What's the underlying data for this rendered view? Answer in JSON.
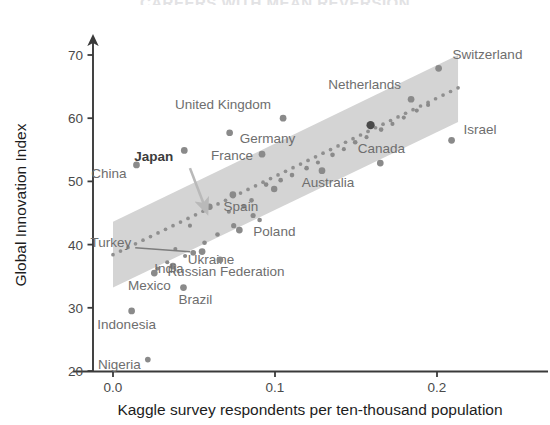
{
  "title": "CAREERS WITH MEAN REVERSION",
  "axes": {
    "x_label": "Kaggle survey respondents per ten-thousand population",
    "y_label": "Global Innovation Index",
    "x_ticks": [
      "0.0",
      "0.1",
      "0.2"
    ],
    "y_ticks": [
      "20",
      "30",
      "40",
      "50",
      "60",
      "70"
    ]
  },
  "colors": {
    "point": "#8a8a8a",
    "point_highlight": "#4a4a4a",
    "band": "#d4d4d4",
    "trend": "#8f8f8f",
    "axis": "#3a3a3a",
    "label": "#6e6e6e",
    "title": "#e2e2e4"
  },
  "chart_data": {
    "type": "scatter",
    "title": "CAREERS WITH MEAN REVERSION",
    "xlabel": "Kaggle survey respondents per ten-thousand population",
    "ylabel": "Global Innovation Index",
    "xlim": [
      -0.012,
      0.225
    ],
    "ylim": [
      19.0,
      72.5
    ],
    "xticks": [
      0.0,
      0.1,
      0.2
    ],
    "yticks": [
      20,
      30,
      40,
      50,
      60,
      70
    ],
    "grid": false,
    "legend": null,
    "points": [
      {
        "label": "Switzerland",
        "x": 0.201,
        "y": 67.9,
        "size": 5.2,
        "label_dx": 14,
        "label_dy": -9,
        "anchor": "start"
      },
      {
        "label": "Netherlands",
        "x": 0.184,
        "y": 63.0,
        "size": 5.2,
        "label_dx": -10,
        "label_dy": -10,
        "anchor": "end"
      },
      {
        "label": "Israel",
        "x": 0.209,
        "y": 56.5,
        "size": 5.2,
        "label_dx": 12,
        "label_dy": -6,
        "anchor": "start"
      },
      {
        "label": "Canada",
        "x": 0.165,
        "y": 52.9,
        "size": 5.2,
        "label_dx": 1,
        "label_dy": -10,
        "anchor": "middle"
      },
      {
        "label": "Australia",
        "x": 0.129,
        "y": 51.7,
        "size": 5.2,
        "label_dx": 6,
        "label_dy": 16,
        "anchor": "middle"
      },
      {
        "label": "United Kingdom",
        "x": 0.105,
        "y": 60.0,
        "size": 5.2,
        "label_dx": -12,
        "label_dy": -9,
        "anchor": "end"
      },
      {
        "label": "Germany",
        "x": 0.072,
        "y": 57.7,
        "size": 5.2,
        "label_dx": 10,
        "label_dy": 10,
        "anchor": "start"
      },
      {
        "label": "France",
        "x": 0.092,
        "y": 54.3,
        "size": 5.2,
        "label_dx": -9,
        "label_dy": 6,
        "anchor": "end"
      },
      {
        "label": "Japan",
        "x": 0.044,
        "y": 54.9,
        "size": 5.2,
        "label_dx": -11,
        "label_dy": 11,
        "anchor": "end",
        "bold": true
      },
      {
        "label": "China",
        "x": 0.0145,
        "y": 52.6,
        "size": 5.2,
        "label_dx": -10,
        "label_dy": 13,
        "anchor": "end"
      },
      {
        "label": "Spain",
        "x": 0.074,
        "y": 47.9,
        "size": 5.2,
        "label_dx": 8,
        "label_dy": 16,
        "anchor": "middle"
      },
      {
        "label": "Poland",
        "x": 0.078,
        "y": 42.3,
        "size": 5.2,
        "label_dx": 14,
        "label_dy": 6,
        "anchor": "start"
      },
      {
        "label": "Ukraine",
        "x": 0.055,
        "y": 38.9,
        "size": 5.2,
        "label_dx": 9,
        "label_dy": 12,
        "anchor": "middle"
      },
      {
        "label": "Russian Federation",
        "x": 0.066,
        "y": 37.6,
        "size": 5.2,
        "label_dx": 6,
        "label_dy": 16,
        "anchor": "middle"
      },
      {
        "label": "Turkey",
        "x": 0.0495,
        "y": 38.7,
        "size": 4.4,
        "label_dx": -62,
        "label_dy": -6,
        "anchor": "end",
        "leader": true
      },
      {
        "label": "India",
        "x": 0.037,
        "y": 36.6,
        "size": 5.2,
        "label_dx": -4,
        "label_dy": 7,
        "anchor": "middle"
      },
      {
        "label": "Mexico",
        "x": 0.0255,
        "y": 35.5,
        "size": 5.2,
        "label_dx": -5,
        "label_dy": 17,
        "anchor": "middle"
      },
      {
        "label": "Brazil",
        "x": 0.0435,
        "y": 33.2,
        "size": 5.2,
        "label_dx": 12,
        "label_dy": 16,
        "anchor": "middle"
      },
      {
        "label": "Indonesia",
        "x": 0.0115,
        "y": 29.5,
        "size": 5.2,
        "label_dx": -5,
        "label_dy": 18,
        "anchor": "middle"
      },
      {
        "label": "Nigeria",
        "x": 0.0215,
        "y": 21.8,
        "size": 4.4,
        "label_dx": -7,
        "label_dy": 9,
        "anchor": "end"
      }
    ],
    "unlabeled_points": [
      {
        "x": 0.0595,
        "y": 46.0,
        "size": 5.0
      },
      {
        "x": 0.0865,
        "y": 44.6,
        "size": 4.0
      },
      {
        "x": 0.0745,
        "y": 43.0,
        "size": 4.0
      },
      {
        "x": 0.0645,
        "y": 41.6,
        "size": 3.6
      },
      {
        "x": 0.0565,
        "y": 40.3,
        "size": 3.6
      },
      {
        "x": 0.0385,
        "y": 39.3,
        "size": 3.2
      },
      {
        "x": 0.0445,
        "y": 38.2,
        "size": 3.2
      },
      {
        "x": 0.0335,
        "y": 37.2,
        "size": 3.2
      },
      {
        "x": 0.0275,
        "y": 36.2,
        "size": 3.2
      },
      {
        "x": 0.0995,
        "y": 48.8,
        "size": 5.0
      },
      {
        "x": 0.0945,
        "y": 49.5,
        "size": 3.6
      },
      {
        "x": 0.1035,
        "y": 50.2,
        "size": 3.6
      },
      {
        "x": 0.1105,
        "y": 51.0,
        "size": 3.6
      },
      {
        "x": 0.1195,
        "y": 52.1,
        "size": 3.6
      },
      {
        "x": 0.1265,
        "y": 53.0,
        "size": 3.2
      },
      {
        "x": 0.1355,
        "y": 54.2,
        "size": 3.6
      },
      {
        "x": 0.1425,
        "y": 55.1,
        "size": 3.2
      },
      {
        "x": 0.1495,
        "y": 56.2,
        "size": 3.6
      },
      {
        "x": 0.1565,
        "y": 57.0,
        "size": 3.2
      },
      {
        "x": 0.1655,
        "y": 58.2,
        "size": 3.6
      },
      {
        "x": 0.1725,
        "y": 59.1,
        "size": 3.2
      },
      {
        "x": 0.1795,
        "y": 60.1,
        "size": 3.2
      },
      {
        "x": 0.1875,
        "y": 61.2,
        "size": 3.2
      },
      {
        "x": 0.1945,
        "y": 62.1,
        "size": 3.2
      },
      {
        "x": 0.0855,
        "y": 47.0,
        "size": 3.6
      },
      {
        "x": 0.0805,
        "y": 46.0,
        "size": 3.2
      },
      {
        "x": 0.0715,
        "y": 45.2,
        "size": 3.2
      },
      {
        "x": 0.0905,
        "y": 43.9,
        "size": 3.6
      },
      {
        "x": 0.0475,
        "y": 43.0,
        "size": 3.2
      }
    ],
    "highlight_point": {
      "x": 0.159,
      "y": 58.9,
      "size": 6.4
    },
    "trend": {
      "type": "dotted-regression",
      "x0": 0.0,
      "y0": 38.4,
      "x1": 0.213,
      "y1": 64.8
    },
    "band": {
      "type": "confidence-interval",
      "x0": 0.0,
      "x1": 0.213,
      "lower0": 33.2,
      "upper0": 43.6,
      "lower1": 59.4,
      "upper1": 70.0
    },
    "annotation_arrow": {
      "from_x": 0.0475,
      "from_y": 52.1,
      "to_x": 0.0565,
      "to_y": 46.1
    }
  }
}
